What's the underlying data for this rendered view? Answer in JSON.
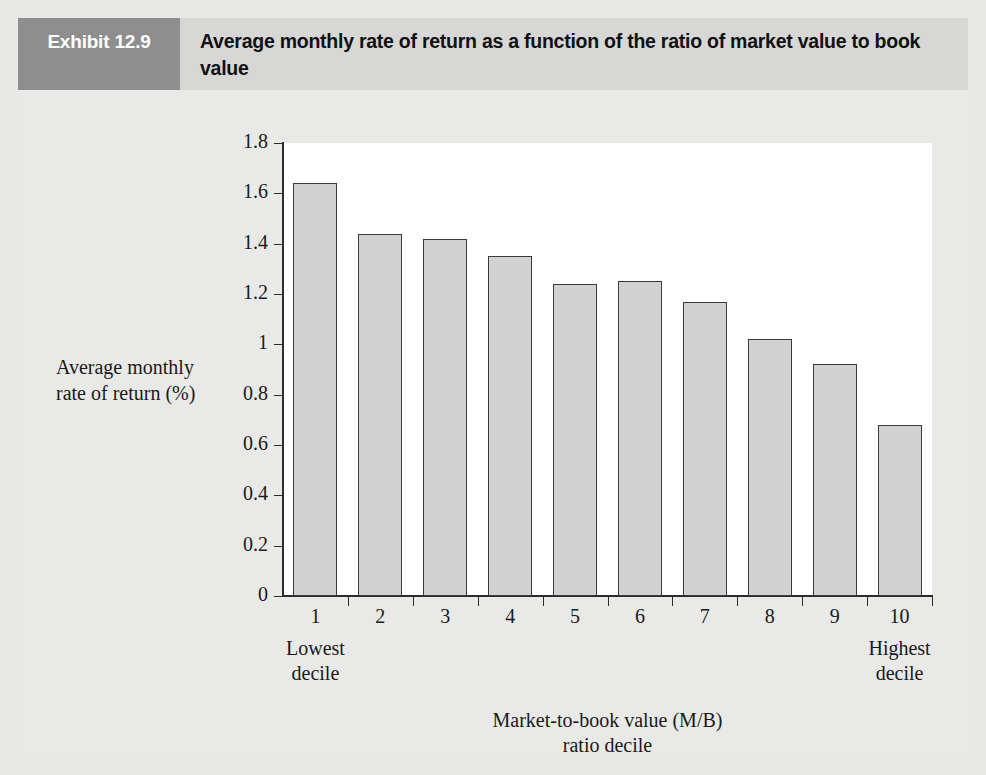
{
  "exhibit": {
    "tag": "Exhibit 12.9",
    "title": "Average monthly rate of return as a function of the ratio of market value to book value"
  },
  "annotations": {
    "lowest_decile": "Lowest\ndecile",
    "lowest_decile_line1": "Lowest",
    "lowest_decile_line2": "decile",
    "highest_decile_line1": "Highest",
    "highest_decile_line2": "decile"
  },
  "colors": {
    "header_band": "#d7d7d5",
    "tag_block": "#8e8e8e",
    "page_background": "#e9e9e7",
    "plot_background": "#ffffff",
    "bar_fill": "#d2d2d2",
    "bar_stroke": "#3a3a3a",
    "axis": "#2b2b2b"
  },
  "chart_data": {
    "type": "bar",
    "title": "Average monthly rate of return as a function of the ratio of market value to book value",
    "subtitle": "",
    "categories": [
      "1",
      "2",
      "3",
      "4",
      "5",
      "6",
      "7",
      "8",
      "9",
      "10"
    ],
    "values": [
      1.64,
      1.44,
      1.42,
      1.35,
      1.24,
      1.25,
      1.17,
      1.02,
      0.92,
      0.68
    ],
    "xlabel": "Market-to-book value (M/B) ratio decile",
    "xlabel_line1": "Market-to-book value (M/B)",
    "xlabel_line2": "ratio decile",
    "ylabel": "Average monthly rate of return (%)",
    "ylabel_line1": "Average monthly",
    "ylabel_line2": "rate of return (%)",
    "ylim": [
      0,
      1.8
    ],
    "ytick_labels": [
      "1.8",
      "1.6",
      "1.4",
      "1.2",
      "1",
      "0.8",
      "0.6",
      "0.4",
      "0.2",
      "0"
    ],
    "ytick_values": [
      1.8,
      1.6,
      1.4,
      1.2,
      1.0,
      0.8,
      0.6,
      0.4,
      0.2,
      0
    ],
    "grid": false,
    "legend": null
  }
}
